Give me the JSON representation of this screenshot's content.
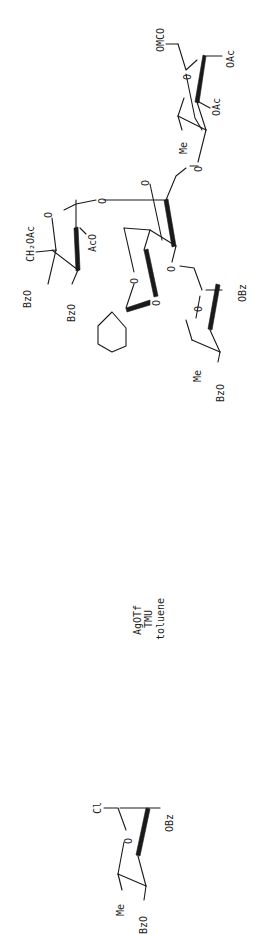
{
  "scheme": {
    "orientation": "rotated-90-ccw",
    "background": "#ffffff",
    "ink": "#1a1a1a",
    "product": {
      "name": "protected trisaccharide / tetrasaccharide product",
      "labels": {
        "anomeric_substituent": "OMCO",
        "oac_1": "OAc",
        "oac_2": "OAc",
        "me_top": "Me",
        "ring_o_top": "O",
        "link_o_1": "O",
        "ring_o_central": "O",
        "link_o_2": "O",
        "ring_o_gal": "O",
        "ch2oac": "CH₂OAc",
        "aco": "AcO",
        "bzo_1": "BzO",
        "bzo_2": "BzO",
        "acetal_o_1": "O",
        "acetal_o_2": "O",
        "link_o_3": "O",
        "ring_o_bottom": "O",
        "obz": "OBz",
        "me_bottom": "Me",
        "bzo_3": "BzO"
      }
    },
    "reagents": {
      "line1": "AgOTf",
      "line2": "TMU",
      "line3": "toluene"
    },
    "donor": {
      "labels": {
        "halide": "Cl",
        "ring_o": "O",
        "obz": "OBz",
        "me": "Me",
        "bzo": "BzO"
      }
    }
  }
}
